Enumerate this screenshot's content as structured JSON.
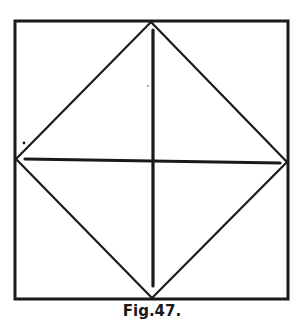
{
  "figure": {
    "caption": "Fig.47.",
    "ink_color": "#1a1a1a",
    "background": "#ffffff"
  },
  "diagram": {
    "outer_square": {
      "x1": 15,
      "y1": 21,
      "x2": 288,
      "y2": 299
    },
    "diamond": {
      "top": [
        151,
        22
      ],
      "right": [
        287,
        162
      ],
      "bottom": [
        152,
        298
      ],
      "left": [
        16,
        159
      ]
    },
    "vertical_line": {
      "x": 153,
      "y1": 30,
      "y2": 286
    },
    "horizontal_line": {
      "x1": 25,
      "y1": 159,
      "x2": 280,
      "y2": 163
    },
    "stray_dots": [
      [
        24,
        143
      ],
      [
        148,
        86
      ]
    ]
  }
}
